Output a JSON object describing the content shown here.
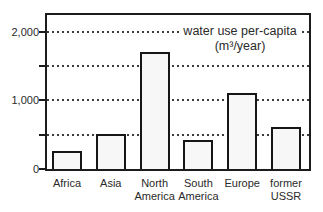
{
  "title": {
    "line1": "water use per-capita",
    "line2": "(m³/year)"
  },
  "chart_data": {
    "type": "bar",
    "title": "water use per-capita (m³/year)",
    "xlabel": "",
    "ylabel": "",
    "categories": [
      "Africa",
      "Asia",
      "North America",
      "South America",
      "Europe",
      "former USSR"
    ],
    "category_tick_lines": [
      [
        "Africa"
      ],
      [
        "Asia"
      ],
      [
        "North",
        "America"
      ],
      [
        "South",
        "America"
      ],
      [
        "Europe"
      ],
      [
        "former",
        "USSR"
      ]
    ],
    "values": [
      255,
      510,
      1700,
      420,
      1110,
      615
    ],
    "ylim": [
      0,
      2240
    ],
    "yticks_labeled": [
      {
        "value": 0,
        "label": "0"
      },
      {
        "value": 1000,
        "label": "1,000"
      },
      {
        "value": 2000,
        "label": "2,000"
      }
    ],
    "ytick_marks": [
      0,
      500,
      1000,
      1500,
      2000
    ],
    "gridlines": [
      500,
      1000,
      1500,
      2000
    ],
    "grid_style": "dotted",
    "legend": "none",
    "bar_fill": "#f7f7f7",
    "bar_border": "#161616"
  },
  "colors": {
    "background": "#ffffff",
    "frame": "#1c1c1c",
    "grid": "#3c3c3c",
    "text": "#2a2a2a"
  }
}
